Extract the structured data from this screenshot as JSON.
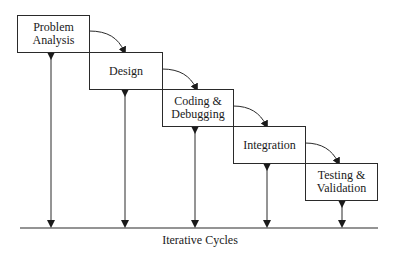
{
  "diagram": {
    "type": "waterfall-process",
    "stages": [
      {
        "id": "problem-analysis",
        "line1": "Problem",
        "line2": "Analysis"
      },
      {
        "id": "design",
        "line1": "Design",
        "line2": ""
      },
      {
        "id": "coding-debugging",
        "line1": "Coding &",
        "line2": "Debugging"
      },
      {
        "id": "integration",
        "line1": "Integration",
        "line2": ""
      },
      {
        "id": "testing-validation",
        "line1": "Testing &",
        "line2": "Validation"
      }
    ],
    "baseline_label": "Iterative Cycles",
    "colors": {
      "stroke": "#2a2a2a",
      "background": "#ffffff",
      "text": "#1a1a1a"
    }
  }
}
